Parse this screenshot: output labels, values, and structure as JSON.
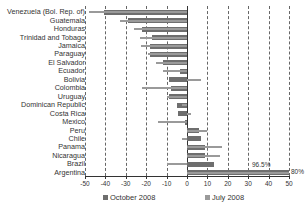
{
  "chart_data": {
    "type": "bar",
    "orientation": "horizontal",
    "title": "",
    "xlabel": "",
    "ylabel": "",
    "xlim": [
      -50,
      50
    ],
    "xticks": [
      -50,
      -40,
      -30,
      -20,
      -10,
      0,
      10,
      20,
      30,
      40,
      50
    ],
    "grid": "vertical dashed",
    "legend_position": "bottom",
    "categories": [
      "Venezuela (Bol. Rep. of)",
      "Guatemala",
      "Honduras",
      "Trinidad and Tobago",
      "Jamaica",
      "Paraguay",
      "El Salvador",
      "Ecuador",
      "Bolivia",
      "Colombia",
      "Uruguay",
      "Dominican Republic",
      "Costa Rica",
      "Mexico",
      "Peru",
      "Chile",
      "Panama",
      "Nicaragua",
      "Brazil",
      "Argentina"
    ],
    "series": [
      {
        "name": "October 2008",
        "color": "#6e6e6e",
        "values": [
          -40.5,
          -29,
          -22,
          -17,
          -18,
          -18,
          -12,
          -3.5,
          -9,
          -8,
          -9,
          -5,
          -4.5,
          -1,
          6,
          7,
          9,
          9,
          13,
          50
        ]
      },
      {
        "name": "July 2008",
        "color": "#9a9a9a",
        "values": [
          -48,
          -33,
          -26,
          -23,
          -22.5,
          -19,
          -15,
          -12,
          7,
          -22,
          -10,
          -2.5,
          2,
          -14,
          10,
          -2.5,
          17,
          16,
          -10,
          50
        ]
      }
    ],
    "annotations": [
      {
        "text": "96.5%",
        "category": "Argentina",
        "series": "July 2008"
      },
      {
        "text": "80%",
        "category": "Argentina",
        "series": "October 2008"
      }
    ]
  },
  "legend": {
    "items": [
      {
        "label": "October 2008",
        "color": "#6e6e6e"
      },
      {
        "label": "July 2008",
        "color": "#9a9a9a"
      }
    ]
  }
}
